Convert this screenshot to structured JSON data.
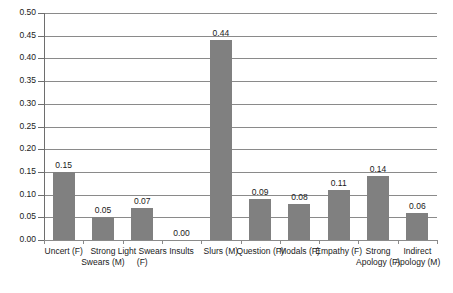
{
  "chart_data": {
    "type": "bar",
    "title": "",
    "subtitle": "",
    "xlabel": "",
    "ylabel": "",
    "ylim": [
      0,
      0.5
    ],
    "grid": true,
    "legend": false,
    "orientation": "vertical",
    "bar_color": "#808080",
    "gridline_color": "#8a8a8a",
    "axis_color": "#6e6e6e",
    "y_ticks": [
      "0.00",
      "0.05",
      "0.10",
      "0.15",
      "0.20",
      "0.25",
      "0.30",
      "0.35",
      "0.40",
      "0.45",
      "0.50"
    ],
    "y_tick_values": [
      0.0,
      0.05,
      0.1,
      0.15,
      0.2,
      0.25,
      0.3,
      0.35,
      0.4,
      0.45,
      0.5
    ],
    "categories": [
      "Uncert (F)",
      "Strong Swears (M)",
      "Light Swears (F)",
      "Insults",
      "Slurs (M)",
      "Question (F)",
      "Modals (F)",
      "Empathy (F)",
      "Strong Apology (F)",
      "Indirect Apology (M)"
    ],
    "values": [
      0.15,
      0.05,
      0.07,
      0.0,
      0.44,
      0.09,
      0.08,
      0.11,
      0.14,
      0.06
    ],
    "data_labels": [
      "0.15",
      "0.05",
      "0.07",
      "0.00",
      "0.44",
      "0.09",
      "0.08",
      "0.11",
      "0.14",
      "0.06"
    ]
  }
}
